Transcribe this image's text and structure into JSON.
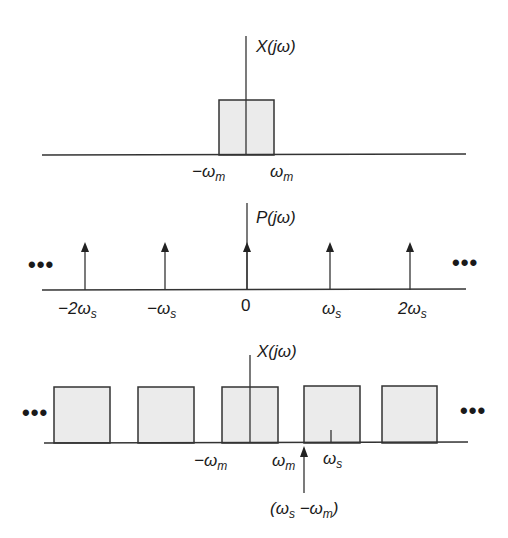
{
  "colors": {
    "line": "#333333",
    "fill": "#ebebeb",
    "text": "#1a1a1a"
  },
  "panels": [
    {
      "id": "top",
      "title": "X(jω)",
      "description": "Spectrum of original band-limited signal",
      "tick_labels": [
        {
          "main": "−ω",
          "sub": "m"
        },
        {
          "main": "ω",
          "sub": "m"
        }
      ]
    },
    {
      "id": "middle",
      "title": "P(jω)",
      "description": "Impulse train spectrum",
      "ellipsis_left": "•••",
      "ellipsis_right": "•••",
      "tick_labels": [
        {
          "main": "−2ω",
          "sub": "s"
        },
        {
          "main": "−ω",
          "sub": "s"
        },
        {
          "main": "0",
          "sub": ""
        },
        {
          "main": "ω",
          "sub": "s"
        },
        {
          "main": "2ω",
          "sub": "s"
        }
      ]
    },
    {
      "id": "bottom",
      "title": "X(jω)",
      "description": "Spectrum of sampled signal (replicated copies)",
      "ellipsis_left": "•••",
      "ellipsis_right": "•••",
      "tick_labels": [
        {
          "main": "−ω",
          "sub": "m"
        },
        {
          "main": "ω",
          "sub": "m"
        },
        {
          "main": "ω",
          "sub": "s"
        }
      ],
      "annotation": {
        "open": "(ω",
        "sub1": "s",
        "mid": " −ω",
        "sub2": "m",
        "close": ")"
      }
    }
  ]
}
